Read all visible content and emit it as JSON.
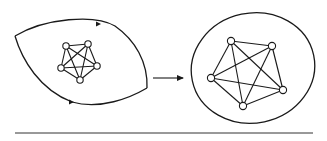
{
  "diagram": {
    "type": "graph-transformation",
    "colors": {
      "line": "#1a1a1a",
      "background": "#ffffff",
      "node_fill": "#ffffff",
      "rule": "#333333"
    },
    "left_region": {
      "shape": "lens / two-arc region with corners",
      "corners": [
        [
          15,
          36
        ],
        [
          147,
          88
        ]
      ],
      "boundary_arrows": [
        {
          "position": [
            99,
            24
          ],
          "direction": "right"
        },
        {
          "position": [
            72,
            102
          ],
          "direction": "right"
        }
      ],
      "graph": {
        "name": "K5",
        "nodes": [
          [
            66,
            46
          ],
          [
            88,
            44
          ],
          [
            97,
            66
          ],
          [
            80,
            80
          ],
          [
            61,
            68
          ]
        ],
        "node_radius": 3.2,
        "edges": "complete"
      }
    },
    "transition_arrow": {
      "from": [
        153,
        78
      ],
      "to": [
        183,
        78
      ],
      "direction": "right"
    },
    "right_region": {
      "shape": "closed round curve",
      "center": [
        253,
        68
      ],
      "rx": 62,
      "ry": 55,
      "graph": {
        "name": "K5",
        "nodes": [
          [
            231,
            41
          ],
          [
            272,
            46
          ],
          [
            283,
            90
          ],
          [
            243,
            106
          ],
          [
            211,
            78
          ]
        ],
        "node_radius": 3.6,
        "edges": "complete"
      }
    },
    "baseline_rule": {
      "x1": 15,
      "x2": 313,
      "y": 133
    }
  }
}
